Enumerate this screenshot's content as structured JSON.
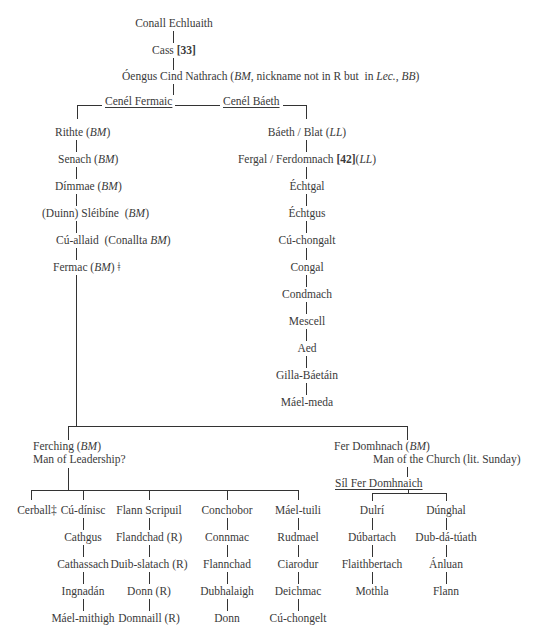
{
  "root": {
    "conall": "Conall Echluaith",
    "cass": "Cass [33]",
    "oengus_name": "Óengus Cind Nathrach",
    "oengus_note": "(BM, nickname not in R but  in Lec., BB)"
  },
  "branches": {
    "left_label": "Cenél Fermaic",
    "right_label": "Cenél Báeth"
  },
  "fermaic_line": [
    "Rithte (BM)",
    "Senach (BM)",
    "Dímmae (BM)",
    "(Duinn) Sléibíne  (BM)",
    "Cú-allaid  (Conallta BM)",
    "Fermac (BM) ǂ"
  ],
  "baeth_line": [
    "Báeth / Blat (LL)",
    "Fergal / Ferdomnach [42](LL)",
    "Échtgal",
    "Échtgus",
    "Cú-chongalt",
    "Congal",
    "Condmach",
    "Mescell",
    "Aed",
    "Gilla-Báetáin",
    "Máel-meda"
  ],
  "ferching": {
    "name": "Ferching (BM)",
    "gloss": "Man of Leadership?"
  },
  "fer_domhnach": {
    "name": "Fer Domhnach (BM)",
    "gloss": "Man of the Church (lit. Sunday)",
    "sept": "Síl Fer Domhnaich"
  },
  "ferching_columns": [
    [
      "Cerball‡"
    ],
    [
      "Cú-dínisc",
      "Cathgus",
      "Cathassach",
      "Ingnadán",
      "Máel-mithigh"
    ],
    [
      "Flann Scripuil",
      "Flandchad (R)",
      "Duib-slatach (R)",
      "Donn (R)",
      "Domnaill (R)"
    ],
    [
      "Conchobor",
      "Connmac",
      "Flannchad",
      "Dubhalaigh",
      "Donn"
    ],
    [
      "Máel-tuili",
      "Rudmael",
      "Ciarodur",
      "Deichmac",
      "Cú-chongelt"
    ]
  ],
  "domhnach_columns": [
    [
      "Dulrí",
      "Dúbartach",
      "Flaithbertach",
      "Mothla"
    ],
    [
      "Dúnghal",
      "Dub-dá-túath",
      "Ánluan",
      "Flann"
    ]
  ]
}
